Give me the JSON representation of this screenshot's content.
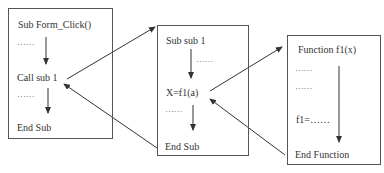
{
  "diagram": {
    "title": "",
    "boxes": [
      {
        "id": "form-click",
        "header": "Sub Form_Click()",
        "dots1": "……",
        "call": "Call sub 1",
        "dots2": "……",
        "footer": "End Sub"
      },
      {
        "id": "sub1",
        "header": "Sub sub 1",
        "dots1": "……",
        "call": "X=f1(a)",
        "dots2": "……",
        "footer": "End Sub"
      },
      {
        "id": "function-f1",
        "header": "Function f1(x)",
        "dots1": "……",
        "dots2": "……",
        "assign": "f1=……",
        "footer": "End Function"
      }
    ],
    "connectors": [
      {
        "from": "Call sub 1",
        "to": "Sub sub 1",
        "kind": "call"
      },
      {
        "from": "End Sub (sub 1)",
        "to": "Call sub 1",
        "kind": "return"
      },
      {
        "from": "X=f1(a)",
        "to": "Function f1(x)",
        "kind": "call"
      },
      {
        "from": "End Function",
        "to": "X=f1(a)",
        "kind": "return"
      }
    ],
    "colors": {
      "line": "#333333",
      "border": "#555555",
      "text": "#333333"
    }
  }
}
